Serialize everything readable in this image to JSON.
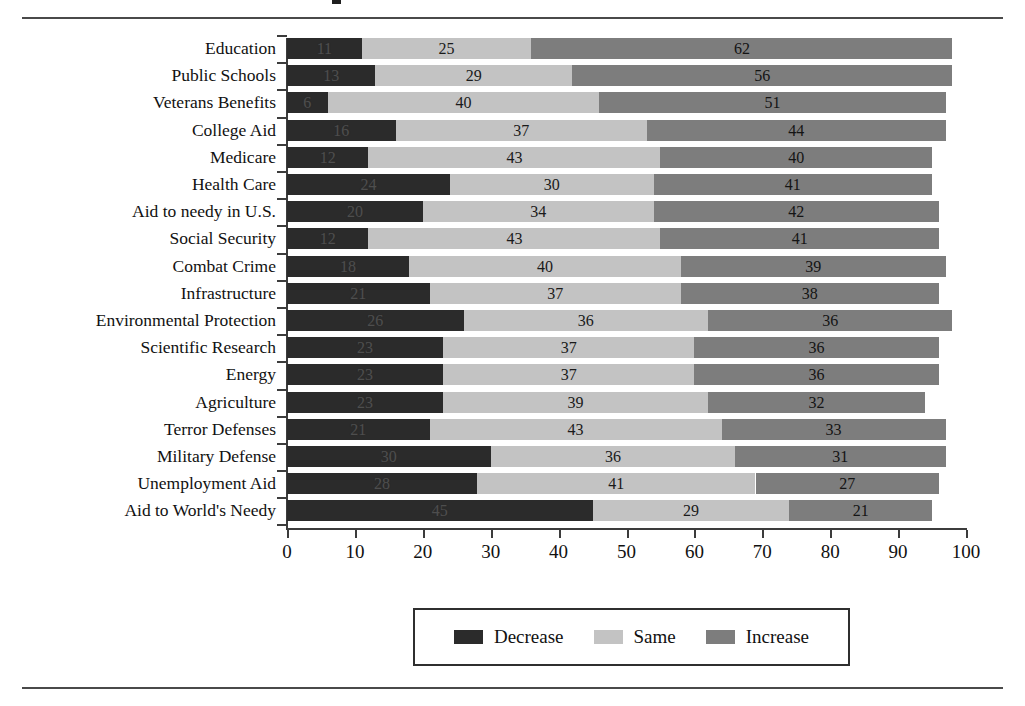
{
  "figure": {
    "rules": [
      "top-rule",
      "bottom-rule"
    ],
    "legend_box_label": "legend"
  },
  "chart_data": {
    "type": "bar",
    "orientation": "horizontal",
    "stacked": true,
    "title": "",
    "xlabel": "",
    "ylabel": "",
    "xlim": [
      0,
      100
    ],
    "grid": false,
    "legend_position": "bottom-center",
    "categories": [
      "Education",
      "Public Schools",
      "Veterans Benefits",
      "College Aid",
      "Medicare",
      "Health Care",
      "Aid to needy in U.S.",
      "Social Security",
      "Combat Crime",
      "Infrastructure",
      "Environmental Protection",
      "Scientific Research",
      "Energy",
      "Agriculture",
      "Terror Defenses",
      "Military Defense",
      "Unemployment Aid",
      "Aid to World's Needy"
    ],
    "series": [
      {
        "name": "Decrease",
        "color": "#2b2b2b",
        "values": [
          11,
          13,
          6,
          16,
          12,
          24,
          20,
          12,
          18,
          21,
          26,
          23,
          23,
          23,
          21,
          30,
          28,
          45
        ]
      },
      {
        "name": "Same",
        "color": "#c3c3c3",
        "values": [
          25,
          29,
          40,
          37,
          43,
          30,
          34,
          43,
          40,
          37,
          36,
          37,
          37,
          39,
          43,
          36,
          41,
          29
        ]
      },
      {
        "name": "Increase",
        "color": "#7d7d7d",
        "values": [
          62,
          56,
          51,
          44,
          40,
          41,
          42,
          41,
          39,
          38,
          36,
          36,
          36,
          32,
          33,
          31,
          27,
          21
        ]
      }
    ],
    "xticks": [
      0,
      10,
      20,
      30,
      40,
      50,
      60,
      70,
      80,
      90,
      100
    ],
    "xtick_labels": [
      "0",
      "10",
      "20",
      "30",
      "40",
      "50",
      "60",
      "70",
      "80",
      "90",
      "100"
    ]
  },
  "legend": {
    "items": [
      {
        "label": "Decrease",
        "color": "#2b2b2b"
      },
      {
        "label": "Same",
        "color": "#c3c3c3"
      },
      {
        "label": "Increase",
        "color": "#7d7d7d"
      }
    ]
  }
}
